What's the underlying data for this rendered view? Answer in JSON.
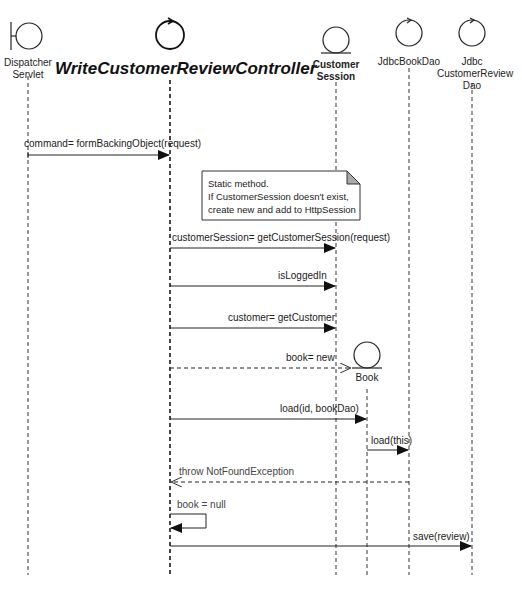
{
  "diagram": {
    "type": "uml-sequence-diagram",
    "participants": [
      {
        "id": "dispatcher",
        "stereotype": "boundary",
        "label_lines": [
          "Dispatcher",
          "Servlet"
        ],
        "x": 28
      },
      {
        "id": "controller",
        "stereotype": "control",
        "label": "WriteCustomerReviewController",
        "x": 170
      },
      {
        "id": "customerSession",
        "stereotype": "entity",
        "label_lines": [
          "Customer",
          "Session"
        ],
        "x": 336
      },
      {
        "id": "book",
        "stereotype": "entity",
        "label": "Book",
        "x": 367
      },
      {
        "id": "jdbcBookDao",
        "stereotype": "control",
        "label": "JdbcBookDao",
        "x": 409
      },
      {
        "id": "jdbcCustomerReviewDao",
        "stereotype": "control",
        "label_lines": [
          "Jdbc",
          "CustomerReview",
          "Dao"
        ],
        "x": 472
      }
    ],
    "note": {
      "lines": [
        "Static method.",
        "If CustomerSession doesn't exist,",
        "create new and add to HttpSession"
      ]
    },
    "messages": [
      {
        "from": "dispatcher",
        "to": "controller",
        "label": "command= formBackingObject(request)",
        "kind": "sync"
      },
      {
        "from": "controller",
        "to": "customerSession",
        "label": "customerSession= getCustomerSession(request)",
        "kind": "sync"
      },
      {
        "from": "controller",
        "to": "customerSession",
        "label": "isLoggedIn",
        "kind": "sync"
      },
      {
        "from": "controller",
        "to": "customerSession",
        "label": "customer= getCustomer",
        "kind": "sync"
      },
      {
        "from": "controller",
        "to": "book",
        "label": "book= new",
        "kind": "create"
      },
      {
        "from": "controller",
        "to": "book",
        "label": "load(id, bookDao)",
        "kind": "sync"
      },
      {
        "from": "book",
        "to": "jdbcBookDao",
        "label": "load(this)",
        "kind": "sync"
      },
      {
        "from": "jdbcBookDao",
        "to": "controller",
        "label": "throw NotFoundException",
        "kind": "return"
      },
      {
        "from": "controller",
        "to": "controller",
        "label": "book = null",
        "kind": "self"
      },
      {
        "from": "controller",
        "to": "jdbcCustomerReviewDao",
        "label": "save(review)",
        "kind": "sync"
      }
    ]
  }
}
